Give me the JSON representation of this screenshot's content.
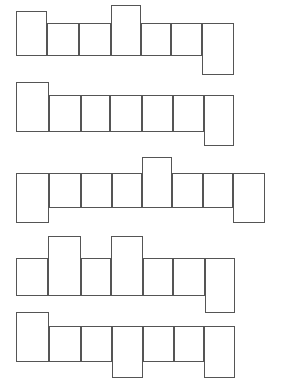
{
  "document": {
    "title": "Polyomino Strip Puzzle Grid",
    "kind": "blank-crossword-style-strips",
    "background_color": "#ffffff",
    "stroke_color": "#555555",
    "cell_fill_color": "#ffffff",
    "canvas": {
      "width": 281,
      "height": 387
    },
    "row_count": 5,
    "note": "Five horizontal strips of empty square/rectangular cells; some cells are shifted up or down from the strip baseline."
  },
  "diagram_data": {
    "type": "diagram",
    "units": "pixels",
    "rows": [
      {
        "id": "row-1",
        "label": "Strip 1",
        "baseline_top": 23,
        "baseline_height": 33,
        "cells": [
          {
            "id": "r1c1",
            "x": 16,
            "y": 11,
            "w": 31,
            "h": 45,
            "offset": "up"
          },
          {
            "id": "r1c2",
            "x": 47,
            "y": 23,
            "w": 32,
            "h": 33,
            "offset": "none"
          },
          {
            "id": "r1c3",
            "x": 79,
            "y": 23,
            "w": 32,
            "h": 33,
            "offset": "none"
          },
          {
            "id": "r1c4",
            "x": 111,
            "y": 5,
            "w": 30,
            "h": 51,
            "offset": "up"
          },
          {
            "id": "r1c5",
            "x": 141,
            "y": 23,
            "w": 30,
            "h": 33,
            "offset": "none"
          },
          {
            "id": "r1c6",
            "x": 171,
            "y": 23,
            "w": 31,
            "h": 33,
            "offset": "none"
          },
          {
            "id": "r1c7",
            "x": 202,
            "y": 23,
            "w": 32,
            "h": 52,
            "offset": "down"
          }
        ]
      },
      {
        "id": "row-2",
        "label": "Strip 2",
        "baseline_top": 95,
        "baseline_height": 37,
        "cells": [
          {
            "id": "r2c1",
            "x": 16,
            "y": 82,
            "w": 33,
            "h": 50,
            "offset": "up"
          },
          {
            "id": "r2c2",
            "x": 49,
            "y": 95,
            "w": 32,
            "h": 37,
            "offset": "none"
          },
          {
            "id": "r2c3",
            "x": 81,
            "y": 95,
            "w": 29,
            "h": 37,
            "offset": "none"
          },
          {
            "id": "r2c4",
            "x": 110,
            "y": 95,
            "w": 32,
            "h": 37,
            "offset": "none"
          },
          {
            "id": "r2c5",
            "x": 142,
            "y": 95,
            "w": 31,
            "h": 37,
            "offset": "none"
          },
          {
            "id": "r2c6",
            "x": 173,
            "y": 95,
            "w": 31,
            "h": 37,
            "offset": "none"
          },
          {
            "id": "r2c7",
            "x": 204,
            "y": 95,
            "w": 30,
            "h": 51,
            "offset": "down"
          }
        ]
      },
      {
        "id": "row-3",
        "label": "Strip 3",
        "baseline_top": 173,
        "baseline_height": 35,
        "cells": [
          {
            "id": "r3c1",
            "x": 16,
            "y": 173,
            "w": 33,
            "h": 50,
            "offset": "down"
          },
          {
            "id": "r3c2",
            "x": 49,
            "y": 173,
            "w": 32,
            "h": 35,
            "offset": "none"
          },
          {
            "id": "r3c3",
            "x": 81,
            "y": 173,
            "w": 31,
            "h": 35,
            "offset": "none"
          },
          {
            "id": "r3c4",
            "x": 112,
            "y": 173,
            "w": 30,
            "h": 35,
            "offset": "none"
          },
          {
            "id": "r3c5",
            "x": 142,
            "y": 157,
            "w": 30,
            "h": 51,
            "offset": "up"
          },
          {
            "id": "r3c6",
            "x": 172,
            "y": 173,
            "w": 31,
            "h": 35,
            "offset": "none"
          },
          {
            "id": "r3c7",
            "x": 203,
            "y": 173,
            "w": 30,
            "h": 35,
            "offset": "none"
          },
          {
            "id": "r3c8",
            "x": 233,
            "y": 173,
            "w": 32,
            "h": 50,
            "offset": "down"
          }
        ]
      },
      {
        "id": "row-4",
        "label": "Strip 4",
        "baseline_top": 258,
        "baseline_height": 38,
        "cells": [
          {
            "id": "r4c1",
            "x": 16,
            "y": 258,
            "w": 32,
            "h": 38,
            "offset": "none"
          },
          {
            "id": "r4c2",
            "x": 48,
            "y": 236,
            "w": 33,
            "h": 60,
            "offset": "up"
          },
          {
            "id": "r4c3",
            "x": 81,
            "y": 258,
            "w": 30,
            "h": 38,
            "offset": "none"
          },
          {
            "id": "r4c4",
            "x": 111,
            "y": 236,
            "w": 32,
            "h": 60,
            "offset": "up"
          },
          {
            "id": "r4c5",
            "x": 143,
            "y": 258,
            "w": 30,
            "h": 38,
            "offset": "none"
          },
          {
            "id": "r4c6",
            "x": 173,
            "y": 258,
            "w": 32,
            "h": 38,
            "offset": "none"
          },
          {
            "id": "r4c7",
            "x": 205,
            "y": 258,
            "w": 30,
            "h": 55,
            "offset": "down"
          }
        ]
      },
      {
        "id": "row-5",
        "label": "Strip 5",
        "baseline_top": 326,
        "baseline_height": 36,
        "cells": [
          {
            "id": "r5c1",
            "x": 16,
            "y": 312,
            "w": 33,
            "h": 50,
            "offset": "up"
          },
          {
            "id": "r5c2",
            "x": 49,
            "y": 326,
            "w": 32,
            "h": 36,
            "offset": "none"
          },
          {
            "id": "r5c3",
            "x": 81,
            "y": 326,
            "w": 31,
            "h": 36,
            "offset": "none"
          },
          {
            "id": "r5c4",
            "x": 112,
            "y": 326,
            "w": 31,
            "h": 52,
            "offset": "down"
          },
          {
            "id": "r5c5",
            "x": 143,
            "y": 326,
            "w": 31,
            "h": 36,
            "offset": "none"
          },
          {
            "id": "r5c6",
            "x": 174,
            "y": 326,
            "w": 30,
            "h": 36,
            "offset": "none"
          },
          {
            "id": "r5c7",
            "x": 204,
            "y": 326,
            "w": 31,
            "h": 52,
            "offset": "down"
          }
        ]
      }
    ]
  }
}
